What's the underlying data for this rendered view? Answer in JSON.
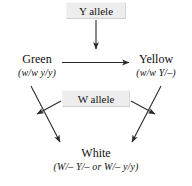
{
  "diagram": {
    "type": "genetics-pathway",
    "background_color": "#ffffff",
    "text_color": "#101010",
    "arrow_color": "#2b2b2b",
    "box_fill_color": "#ededed"
  },
  "nodes": {
    "y_allele": {
      "label": "Y allele",
      "kind": "allele-box"
    },
    "w_allele": {
      "label": "W allele",
      "kind": "allele-box"
    },
    "green": {
      "name": "Green",
      "genotype": "(w/w y/y)",
      "kind": "phenotype"
    },
    "yellow": {
      "name": "Yellow",
      "genotype": "(w/w Y/–)",
      "kind": "phenotype"
    },
    "white": {
      "name": "White",
      "genotype": "(W/– Y/– or W/– y/y)",
      "kind": "phenotype"
    }
  },
  "arrows": [
    {
      "name": "y-allele-to-green-yellow-step",
      "from": "y_allele",
      "to": "green-to-yellow-conversion",
      "direction": "down"
    },
    {
      "name": "green-to-yellow",
      "from": "green",
      "to": "yellow",
      "direction": "right"
    },
    {
      "name": "green-to-white",
      "from": "green",
      "to": "white",
      "direction": "down-right"
    },
    {
      "name": "yellow-to-white",
      "from": "yellow",
      "to": "white",
      "direction": "down-left"
    },
    {
      "name": "w-allele-to-left-step",
      "from": "w_allele",
      "to": "green-to-white-conversion",
      "direction": "down-left"
    },
    {
      "name": "w-allele-to-right-step",
      "from": "w_allele",
      "to": "yellow-to-white-conversion",
      "direction": "down-right"
    }
  ]
}
